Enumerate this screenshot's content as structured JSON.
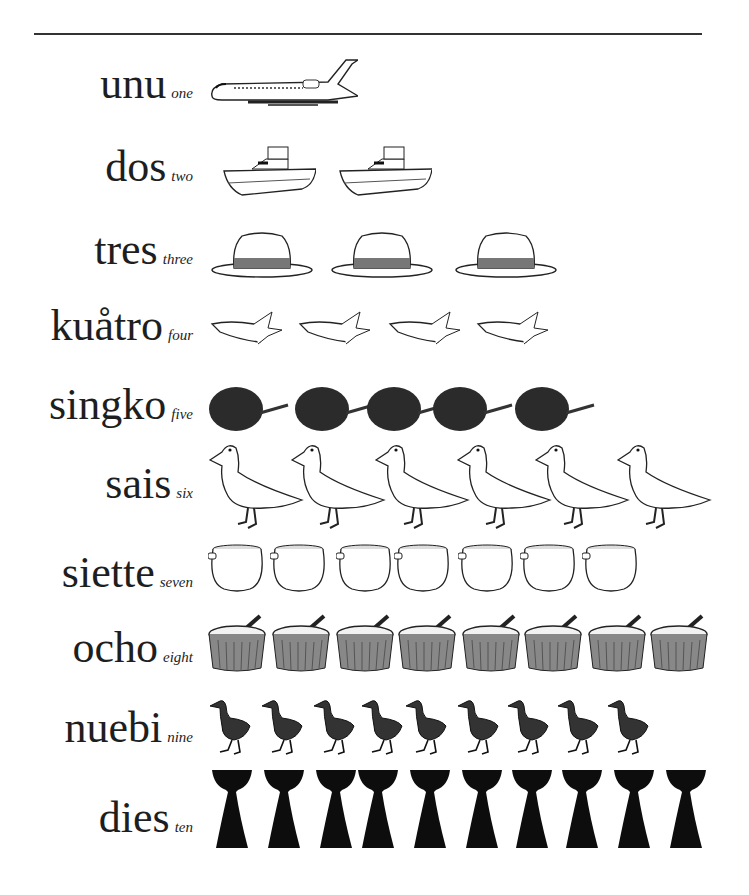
{
  "header": {
    "title_cutoff": true
  },
  "rows": [
    {
      "word": "unu",
      "english": "one",
      "count": 1,
      "item": "airplane"
    },
    {
      "word": "dos",
      "english": "two",
      "count": 2,
      "item": "boat"
    },
    {
      "word": "tres",
      "english": "three",
      "count": 3,
      "item": "hat"
    },
    {
      "word": "kuåtro",
      "english": "four",
      "count": 4,
      "item": "banana"
    },
    {
      "word": "singko",
      "english": "five",
      "count": 5,
      "item": "fruit"
    },
    {
      "word": "sais",
      "english": "six",
      "count": 6,
      "item": "duck"
    },
    {
      "word": "siette",
      "english": "seven",
      "count": 7,
      "item": "clay-pot"
    },
    {
      "word": "ocho",
      "english": "eight",
      "count": 8,
      "item": "cooking-pot"
    },
    {
      "word": "nuebi",
      "english": "nine",
      "count": 9,
      "item": "bird"
    },
    {
      "word": "dies",
      "english": "ten",
      "count": 10,
      "item": "latte-stone"
    }
  ]
}
